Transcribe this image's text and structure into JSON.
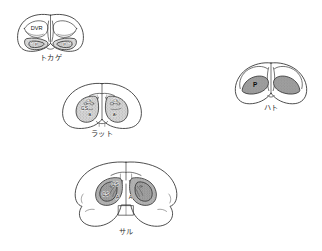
{
  "figure": {
    "kind": "comparative-neuroanatomy-plate",
    "background_color": "#ffffff",
    "ink_color": "#2e2e2e",
    "fill_light": "#d9d9d9",
    "fill_mid": "#b0b0b0",
    "fill_dark": "#8f8f8f"
  },
  "panels": {
    "lizard": {
      "caption": "トカゲ",
      "labels": {
        "dvr": "DVR",
        "left_mark": "*",
        "left_p": "P",
        "right_mark": "*",
        "right_p": "P"
      }
    },
    "rat": {
      "caption": "ラット",
      "labels": {
        "cs_left_upper": "CS",
        "cs_left_lower": "CS",
        "a_left": "A",
        "cs_right_upper": "CS",
        "a_right": "A"
      }
    },
    "pigeon": {
      "caption": "ハト",
      "labels": {
        "p_left": "P"
      }
    },
    "monkey": {
      "caption": "サル",
      "labels": {
        "cs_left_upper": "CS",
        "cs_left_lower": "CS",
        "a_left": "A",
        "a_right": "A"
      }
    }
  }
}
